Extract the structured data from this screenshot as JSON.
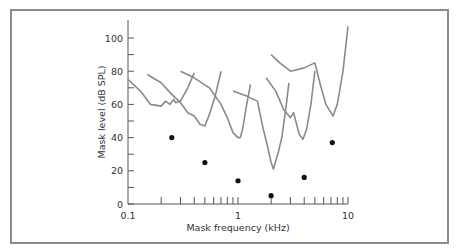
{
  "chart_data": {
    "type": "line",
    "title": "",
    "xlabel": "Mask frequency (kHz)",
    "ylabel": "Mask level (dB SPL)",
    "xscale": "log",
    "xlim": [
      0.1,
      10
    ],
    "ylim": [
      0,
      110
    ],
    "grid": false,
    "legend": null,
    "x_tick_labels": [
      "0.1",
      "1",
      "10"
    ],
    "y_tick_labels": [
      "0",
      "20",
      "40",
      "60",
      "80",
      "100"
    ],
    "series": [
      {
        "name": "tuning curve 1 (probe 0.25 kHz)",
        "points": [
          [
            0.1,
            75
          ],
          [
            0.13,
            68
          ],
          [
            0.16,
            60
          ],
          [
            0.2,
            59
          ],
          [
            0.22,
            62
          ],
          [
            0.24,
            60
          ],
          [
            0.26,
            63
          ],
          [
            0.27,
            61
          ],
          [
            0.3,
            62
          ],
          [
            0.35,
            70
          ],
          [
            0.4,
            79
          ]
        ]
      },
      {
        "name": "tuning curve 2 (probe 0.5 kHz)",
        "points": [
          [
            0.15,
            78
          ],
          [
            0.2,
            73
          ],
          [
            0.25,
            66
          ],
          [
            0.3,
            61
          ],
          [
            0.35,
            55
          ],
          [
            0.4,
            53
          ],
          [
            0.43,
            50
          ],
          [
            0.45,
            48
          ],
          [
            0.5,
            47
          ],
          [
            0.55,
            54
          ],
          [
            0.62,
            65
          ],
          [
            0.7,
            80
          ]
        ]
      },
      {
        "name": "tuning curve 3 (probe 1 kHz)",
        "points": [
          [
            0.3,
            80
          ],
          [
            0.4,
            76
          ],
          [
            0.55,
            70
          ],
          [
            0.7,
            60
          ],
          [
            0.8,
            52
          ],
          [
            0.9,
            43
          ],
          [
            1.0,
            40
          ],
          [
            1.05,
            40
          ],
          [
            1.1,
            45
          ],
          [
            1.2,
            60
          ],
          [
            1.3,
            72
          ]
        ]
      },
      {
        "name": "tuning curve 4 (probe 2 kHz)",
        "points": [
          [
            0.9,
            68
          ],
          [
            1.2,
            65
          ],
          [
            1.5,
            62
          ],
          [
            1.7,
            45
          ],
          [
            1.85,
            35
          ],
          [
            2.0,
            25
          ],
          [
            2.1,
            21
          ],
          [
            2.3,
            30
          ],
          [
            2.5,
            40
          ],
          [
            2.7,
            56
          ],
          [
            2.9,
            73
          ]
        ]
      },
      {
        "name": "tuning curve 5 (probe 4 kHz)",
        "points": [
          [
            1.8,
            76
          ],
          [
            2.2,
            68
          ],
          [
            2.6,
            57
          ],
          [
            3.0,
            52
          ],
          [
            3.2,
            55
          ],
          [
            3.6,
            42
          ],
          [
            3.9,
            39
          ],
          [
            4.2,
            45
          ],
          [
            4.6,
            60
          ],
          [
            5.0,
            80
          ]
        ]
      },
      {
        "name": "tuning curve 6 (probe 8 kHz)",
        "points": [
          [
            2.0,
            90
          ],
          [
            2.4,
            85
          ],
          [
            3.0,
            80
          ],
          [
            4.0,
            82
          ],
          [
            5.0,
            85
          ],
          [
            5.6,
            72
          ],
          [
            6.3,
            60
          ],
          [
            7.0,
            55
          ],
          [
            7.3,
            53
          ],
          [
            8.0,
            60
          ],
          [
            9.0,
            80
          ],
          [
            10.0,
            107
          ]
        ]
      }
    ],
    "probe_points": {
      "name": "probe tones",
      "points": [
        [
          0.25,
          40
        ],
        [
          0.5,
          25
        ],
        [
          1.0,
          14
        ],
        [
          2.0,
          5
        ],
        [
          4.0,
          16
        ],
        [
          7.2,
          37
        ]
      ]
    }
  }
}
